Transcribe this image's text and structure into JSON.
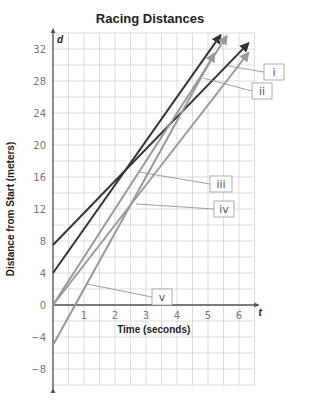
{
  "chart_data": {
    "type": "line",
    "title": "Racing Distances",
    "xlabel": "Time (seconds)",
    "ylabel": "Distance from Start (meters)",
    "x_axis_var": "t",
    "y_axis_var": "d",
    "xlim": [
      0,
      6.5
    ],
    "ylim": [
      -10,
      34
    ],
    "x_ticks": [
      1,
      2,
      3,
      4,
      5,
      6
    ],
    "y_ticks": [
      -8,
      -4,
      0,
      4,
      8,
      12,
      16,
      20,
      24,
      28,
      32
    ],
    "grid": true,
    "series": [
      {
        "name": "line-a",
        "color": "#333333",
        "intercept": 7.5,
        "slope": 4,
        "x_end": 6.3
      },
      {
        "name": "line-b",
        "color": "#333333",
        "intercept": 4,
        "slope": 5.5,
        "x_end": 5.4
      },
      {
        "name": "line-c",
        "color": "#999999",
        "intercept": 0,
        "slope": 6,
        "x_end": 5.6
      },
      {
        "name": "line-d",
        "color": "#999999",
        "intercept": 0,
        "slope": 5,
        "x_end": 6.3
      },
      {
        "name": "line-e",
        "color": "#999999",
        "intercept": -5,
        "slope": 7,
        "x_end": 5.2
      }
    ],
    "annotations": [
      {
        "label": "i",
        "box": [
          264,
          64
        ],
        "point": [
          228,
          66
        ]
      },
      {
        "label": "ii",
        "box": [
          252,
          83
        ],
        "point": [
          203,
          78
        ]
      },
      {
        "label": "iii",
        "box": [
          210,
          176
        ],
        "point": [
          139,
          172
        ]
      },
      {
        "label": "iv",
        "box": [
          214,
          201
        ],
        "point": [
          136,
          204
        ]
      },
      {
        "label": "v",
        "box": [
          152,
          289
        ],
        "point": [
          87,
          284
        ]
      }
    ]
  }
}
